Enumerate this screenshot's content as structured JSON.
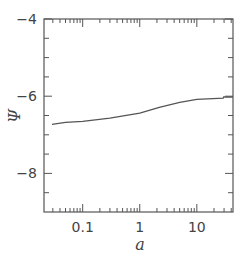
{
  "chart_data": {
    "type": "line",
    "title": "",
    "xlabel": "a",
    "ylabel": "Ψ",
    "xscale": "log",
    "xlim": [
      0.021,
      43
    ],
    "ylim": [
      -9,
      -4
    ],
    "grid": false,
    "legend": null,
    "x_tick_labels": [
      {
        "value": 0.1,
        "label": "0.1"
      },
      {
        "value": 1,
        "label": "1"
      },
      {
        "value": 10,
        "label": "10"
      }
    ],
    "y_tick_labels": [
      {
        "value": -4,
        "label": "−4"
      },
      {
        "value": -6,
        "label": "−6"
      },
      {
        "value": -8,
        "label": "−8"
      }
    ],
    "y_minor_ticks": [
      -4.5,
      -5,
      -5.5,
      -6.5,
      -7,
      -7.5,
      -8.5
    ],
    "series": [
      {
        "name": "Ψ(a)",
        "color": "#555555",
        "x": [
          0.029,
          0.05,
          0.1,
          0.3,
          1,
          2.2,
          5,
          10,
          29,
          29.5,
          43
        ],
        "y": [
          -6.73,
          -6.68,
          -6.65,
          -6.57,
          -6.44,
          -6.29,
          -6.16,
          -6.08,
          -6.05,
          -6.02,
          -6.02
        ]
      }
    ]
  }
}
